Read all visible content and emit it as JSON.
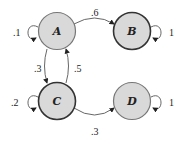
{
  "diagram": {
    "type": "markov-chain",
    "nodes": [
      {
        "id": "A",
        "label": "A",
        "fill": "#d9d9d9",
        "stroke": "#777777"
      },
      {
        "id": "B",
        "label": "B",
        "fill": "#d9d9d9",
        "stroke": "#333333"
      },
      {
        "id": "C",
        "label": "C",
        "fill": "#d9d9d9",
        "stroke": "#333333"
      },
      {
        "id": "D",
        "label": "D",
        "fill": "#d9d9d9",
        "stroke": "#777777"
      }
    ],
    "edges": [
      {
        "from": "A",
        "to": "A",
        "label": ".1"
      },
      {
        "from": "A",
        "to": "B",
        "label": ".6"
      },
      {
        "from": "A",
        "to": "C",
        "label": ".3"
      },
      {
        "from": "C",
        "to": "A",
        "label": ".5"
      },
      {
        "from": "B",
        "to": "B",
        "label": "1"
      },
      {
        "from": "C",
        "to": "C",
        "label": ".2"
      },
      {
        "from": "C",
        "to": "D",
        "label": ".3"
      },
      {
        "from": "D",
        "to": "D",
        "label": "1"
      }
    ]
  }
}
